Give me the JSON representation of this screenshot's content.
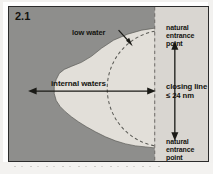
{
  "figure": {
    "number": "2.1",
    "caption_labels": {
      "low_water": "low water",
      "internal_waters": "internal waters",
      "closing_line": "closing line",
      "closing_line_distance": "≤ 24 nm",
      "natural_entrance_point_top": "natural entrance point",
      "natural_entrance_point_bottom": "natural entrance point"
    }
  },
  "colors": {
    "land_sea_gray": "#8e8e8c",
    "bay_interior": "#e2dfd9",
    "outer_sea_strip": "#d9d6d1",
    "line_dark": "#1a1a16",
    "frame_border": "#2b2b2b",
    "page_background": "#ffffff"
  },
  "geometry": {
    "closing_line_x": 150,
    "measure_arrow_x": 170,
    "internal_waters_arrow_y": 87,
    "closing_line_style": "dashed-vertical",
    "arc_style": "dashed-semicircle"
  }
}
